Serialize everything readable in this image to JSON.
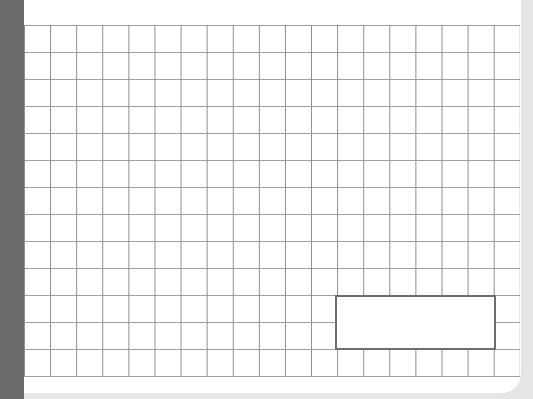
{
  "canvas": {
    "width": 533,
    "height": 399,
    "background": "#ffffff"
  },
  "left_bar": {
    "color": "#6a6a6a"
  },
  "grid": {
    "columns": 19,
    "rows": 13,
    "line_color": "#a0a0a0",
    "cell_width": 26,
    "cell_height": 27
  },
  "highlight_box": {
    "label": "",
    "border_color": "#6e6e6e",
    "grid_col_start": 12,
    "grid_row_start": 10,
    "col_span": 6,
    "row_span": 2
  }
}
